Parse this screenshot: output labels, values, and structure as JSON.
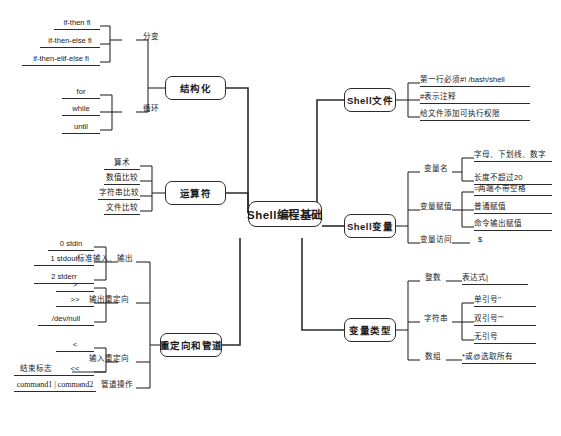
{
  "diagram": {
    "title": "Shell编程基础",
    "type": "mindmap",
    "accent_color": "#2b2b2b",
    "background_color": "#ffffff"
  },
  "root": {
    "label": "Shell编程基础"
  },
  "branches": {
    "structured": {
      "label": "结构化",
      "children": {
        "branch": {
          "label": "分变",
          "items": [
            {
              "label": "if-then fi"
            },
            {
              "label": "if-then-else fi"
            },
            {
              "label": "if-then-elif-else fi"
            }
          ]
        },
        "loop": {
          "label": "循环",
          "items": [
            {
              "label": "for"
            },
            {
              "label": "while"
            },
            {
              "label": "until"
            }
          ]
        }
      }
    },
    "operators": {
      "label": "运算符",
      "items": [
        {
          "label": "算术"
        },
        {
          "label": "数值比较"
        },
        {
          "label": "字符串比较"
        },
        {
          "label": "文件比较"
        }
      ]
    },
    "redirect": {
      "label": "重定向和管道",
      "children": {
        "stdio": {
          "label": "标准输入、输出",
          "items": [
            {
              "label": "0 stdin"
            },
            {
              "label": "1 stdout"
            },
            {
              "label": "2 stderr"
            }
          ]
        },
        "out": {
          "label": "输出重定向",
          "items": [
            {
              "label": ">"
            },
            {
              "label": ">>"
            },
            {
              "label": "/dev/null"
            }
          ]
        },
        "in": {
          "label": "输入重定向",
          "items": [
            {
              "label": "<"
            },
            {
              "label": "<<"
            },
            {
              "label": "结束标志"
            }
          ]
        },
        "pipe": {
          "label": "管道操作",
          "items": [
            {
              "label": "command1 | command2"
            }
          ]
        }
      }
    },
    "shellfile": {
      "label": "Shell文件",
      "items": [
        {
          "label": "第一行必须#! /bash/shell"
        },
        {
          "label": "#表示注释"
        },
        {
          "label": "给文件添加可执行权限"
        }
      ]
    },
    "shellvar": {
      "label": "Shell变量",
      "children": {
        "name": {
          "label": "变量名",
          "items": [
            {
              "label": "字母、下划线、数字"
            },
            {
              "label": "长度不超过20"
            }
          ]
        },
        "assign": {
          "label": "变量赋值",
          "items": [
            {
              "label": "=两端不带空格"
            },
            {
              "label": "普通赋值"
            },
            {
              "label": "命令输出赋值"
            }
          ]
        },
        "access": {
          "label": "变量访问",
          "items": [
            {
              "label": "$"
            }
          ]
        }
      }
    },
    "vartype": {
      "label": "变量类型",
      "children": {
        "integer": {
          "label": "整数",
          "items": [
            {
              "label": "表达式|"
            }
          ]
        },
        "string": {
          "label": "字符串",
          "items": [
            {
              "label": "单引号''"
            },
            {
              "label": "双引号\"\""
            },
            {
              "label": "无引号"
            }
          ]
        },
        "array": {
          "label": "数组",
          "items": [
            {
              "label": "*或@选取所有"
            }
          ]
        }
      }
    }
  }
}
